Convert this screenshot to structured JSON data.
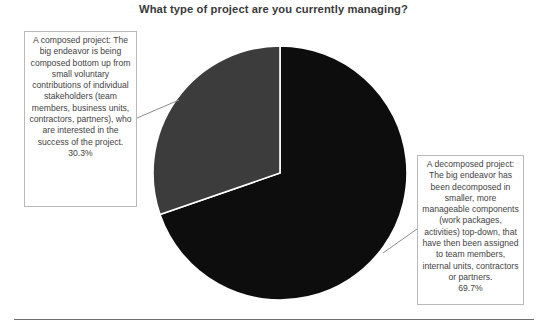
{
  "chart_data": {
    "type": "pie",
    "title": "What type of project are you currently managing?",
    "categories": [
      "A decomposed project",
      "A composed project"
    ],
    "values": [
      69.7,
      30.3
    ],
    "value_labels": [
      "69.7%",
      "30.3%"
    ],
    "units": "percent",
    "legend": "none",
    "grid": false,
    "slices": [
      {
        "name": "A decomposed project",
        "value": 69.7,
        "label": "69.7%",
        "color": "#0d0d0d",
        "start_angle_deg": 0,
        "end_angle_deg": 250.92
      },
      {
        "name": "A composed project",
        "value": 30.3,
        "label": "30.3%",
        "color": "#3c3c3c",
        "start_angle_deg": 250.92,
        "end_angle_deg": 360
      }
    ],
    "annotations": [
      {
        "position": "left",
        "text": "A composed project: The big endeavor is being composed bottom up from small voluntary contributions of individual stakeholders (team members, business units, contractors, partners), who are interested in the success of the project.",
        "value_label": "30.3%"
      },
      {
        "position": "right",
        "text": "A decomposed project: The big endeavor has been decomposed in smaller, more manageable components (work packages, activities) top-down, that have then been assigned to team members, internal units, contractors or partners.",
        "value_label": "69.7%"
      }
    ]
  },
  "title": {
    "text": "What type of project are you currently managing?"
  },
  "callouts": {
    "left": {
      "text": "A composed project: The big endeavor is being composed bottom up from small voluntary contributions of individual stakeholders (team members, business units, contractors, partners), who are interested in the success of the project.",
      "percent": "30.3%"
    },
    "right": {
      "text": "A decomposed project: The big endeavor has been decomposed in smaller, more manageable components (work packages, activities) top-down, that have then been assigned to team members, internal units, contractors or partners.",
      "percent": "69.7%"
    }
  },
  "colors": {
    "slice_decomposed": "#0d0d0d",
    "slice_composed": "#3c3c3c",
    "slice_border": "#ffffff",
    "callout_border": "#b9b9b9",
    "text": "#3f3f3f",
    "title_text": "#3a3a3a",
    "rule": "#6e6e6e",
    "leader_line": "#8c8c8c"
  }
}
